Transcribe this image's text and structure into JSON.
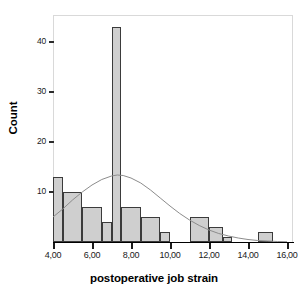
{
  "chart_data": {
    "type": "bar",
    "title": "",
    "subtitle": "",
    "xlabel": "postoperative job strain",
    "ylabel": "Count",
    "xlim": [
      3.6,
      16.4
    ],
    "ylim": [
      0,
      45
    ],
    "grid": false,
    "legend": null,
    "x_ticks": [
      "4,00",
      "6,00",
      "8,00",
      "10,00",
      "12,00",
      "14,00",
      "16,00"
    ],
    "x_tick_values": [
      4,
      6,
      8,
      10,
      12,
      14,
      16
    ],
    "y_ticks": [
      "10",
      "20",
      "30",
      "40"
    ],
    "y_tick_values": [
      10,
      20,
      30,
      40
    ],
    "bins": [
      {
        "label": "4,0-4,5",
        "x0": 4.0,
        "x1": 4.5,
        "value": 13
      },
      {
        "label": "4,5-5,5",
        "x0": 4.5,
        "x1": 5.5,
        "value": 10
      },
      {
        "label": "5,5-6,5",
        "x0": 5.5,
        "x1": 6.5,
        "value": 7
      },
      {
        "label": "6,5-7,0",
        "x0": 6.5,
        "x1": 7.0,
        "value": 4
      },
      {
        "label": "7,0-7,5",
        "x0": 7.0,
        "x1": 7.5,
        "value": 43
      },
      {
        "label": "7,5-8,5",
        "x0": 7.5,
        "x1": 8.5,
        "value": 7
      },
      {
        "label": "8,5-9,5",
        "x0": 8.5,
        "x1": 9.5,
        "value": 5
      },
      {
        "label": "9,5-10,0",
        "x0": 9.5,
        "x1": 10.0,
        "value": 2
      },
      {
        "label": "11,0-12,0",
        "x0": 11.0,
        "x1": 12.0,
        "value": 5
      },
      {
        "label": "12,0-12,7",
        "x0": 12.0,
        "x1": 12.7,
        "value": 3
      },
      {
        "label": "12,7-13,2",
        "x0": 12.7,
        "x1": 13.2,
        "value": 1
      },
      {
        "label": "14,5-15,3",
        "x0": 14.5,
        "x1": 15.3,
        "value": 2
      }
    ],
    "overlay_curve": {
      "name": "normal",
      "mean": 7.3,
      "peak_value": 13.4,
      "points": [
        {
          "x": 4.0,
          "y": 5.0
        },
        {
          "x": 4.5,
          "y": 6.6
        },
        {
          "x": 5.0,
          "y": 8.4
        },
        {
          "x": 5.5,
          "y": 10.0
        },
        {
          "x": 6.0,
          "y": 11.4
        },
        {
          "x": 6.5,
          "y": 12.5
        },
        {
          "x": 7.0,
          "y": 13.2
        },
        {
          "x": 7.3,
          "y": 13.4
        },
        {
          "x": 7.6,
          "y": 13.3
        },
        {
          "x": 8.0,
          "y": 12.8
        },
        {
          "x": 8.5,
          "y": 11.8
        },
        {
          "x": 9.0,
          "y": 10.4
        },
        {
          "x": 9.5,
          "y": 8.8
        },
        {
          "x": 10.0,
          "y": 7.2
        },
        {
          "x": 10.5,
          "y": 5.7
        },
        {
          "x": 11.0,
          "y": 4.4
        },
        {
          "x": 11.5,
          "y": 3.3
        },
        {
          "x": 12.0,
          "y": 2.4
        },
        {
          "x": 12.5,
          "y": 1.7
        },
        {
          "x": 13.0,
          "y": 1.2
        },
        {
          "x": 13.5,
          "y": 0.8
        },
        {
          "x": 14.0,
          "y": 0.5
        },
        {
          "x": 14.5,
          "y": 0.3
        },
        {
          "x": 15.0,
          "y": 0.2
        },
        {
          "x": 15.5,
          "y": 0.1
        },
        {
          "x": 16.0,
          "y": 0.05
        }
      ]
    },
    "colors": {
      "bar_fill": "#cfcfcf",
      "bar_border": "#3b3b3b",
      "curve": "#8c8c8c",
      "axis": "#1a1a1a",
      "frame": "#d9d9d9",
      "text": "#000000",
      "background": "#ffffff"
    }
  }
}
